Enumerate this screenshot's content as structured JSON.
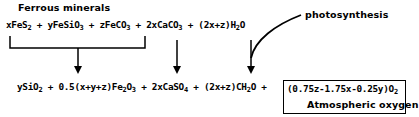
{
  "labels": {
    "ferrous_minerals": "Ferrous minerals",
    "photosynthesis": "photosynthesis",
    "atmospheric_oxygen": "Atmospheric oxygen"
  },
  "reactants": [
    {
      "coef": "x",
      "formula": "FeS",
      "sub": "2",
      "tail": ""
    },
    {
      "coef": "y",
      "formula": "FeSiO",
      "sub": "3",
      "tail": ""
    },
    {
      "coef": "z",
      "formula": "FeCO",
      "sub": "3",
      "tail": ""
    },
    {
      "coef": "2x",
      "formula": "CaCO",
      "sub": "3",
      "tail": ""
    },
    {
      "coef": "(2x+z)",
      "formula": "H",
      "sub": "2",
      "tail": "O"
    }
  ],
  "products": [
    {
      "coef": "y",
      "formula": "SiO",
      "sub": "2",
      "tail": ""
    },
    {
      "coef": "0.5(x+y+z)",
      "formula": "Fe",
      "sub": "2",
      "tail": "O",
      "sub2": "3"
    },
    {
      "coef": "2x",
      "formula": "CaSO",
      "sub": "4",
      "tail": ""
    },
    {
      "coef": "(2x+z)",
      "formula": "CH",
      "sub": "2",
      "tail": "O"
    },
    {
      "coef": "(0.75z-1.75x-0.25y)",
      "formula": "O",
      "sub": "2",
      "tail": ""
    }
  ],
  "operator": "+"
}
